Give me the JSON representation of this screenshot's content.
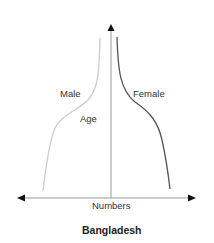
{
  "diagram": {
    "title": "Bangladesh",
    "x_axis_label": "Numbers",
    "y_axis_label": "Age",
    "series": [
      {
        "name": "Male",
        "color": "#c8c8c8"
      },
      {
        "name": "Female",
        "color": "#555555"
      }
    ],
    "axis_color": "#888888",
    "arrow_color": "#111111"
  }
}
